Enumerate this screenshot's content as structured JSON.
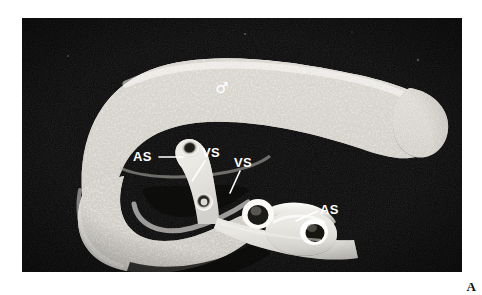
{
  "figure": {
    "panel_label": "A",
    "background_color": "#ffffff",
    "plate": {
      "background_color": "#080808",
      "x": 22,
      "y": 18,
      "width": 440,
      "height": 254
    }
  },
  "annotations": [
    {
      "id": "male-symbol",
      "text": "♂",
      "type": "symbol",
      "x": 222,
      "y": 93,
      "leader": null
    },
    {
      "id": "as-left",
      "text": "AS",
      "type": "label",
      "x": 133,
      "y": 161,
      "leader": {
        "x1": 159,
        "y1": 157,
        "x2": 183,
        "y2": 157
      }
    },
    {
      "id": "vs-left",
      "text": "VS",
      "type": "label",
      "x": 202,
      "y": 157,
      "leader": {
        "x1": 205,
        "y1": 160,
        "x2": 192,
        "y2": 180
      }
    },
    {
      "id": "vs-right",
      "text": "VS",
      "type": "label",
      "x": 234,
      "y": 167,
      "leader": {
        "x1": 240,
        "y1": 170,
        "x2": 230,
        "y2": 192
      }
    },
    {
      "id": "as-right",
      "text": "AS",
      "type": "label",
      "x": 320,
      "y": 214,
      "leader": {
        "x1": 318,
        "y1": 211,
        "x2": 297,
        "y2": 221
      }
    }
  ],
  "specimen": {
    "male_body_tone": "#e8e6e2",
    "female_body_tone": "#efeeeb",
    "shadow_tone": "#0a0a0a"
  }
}
